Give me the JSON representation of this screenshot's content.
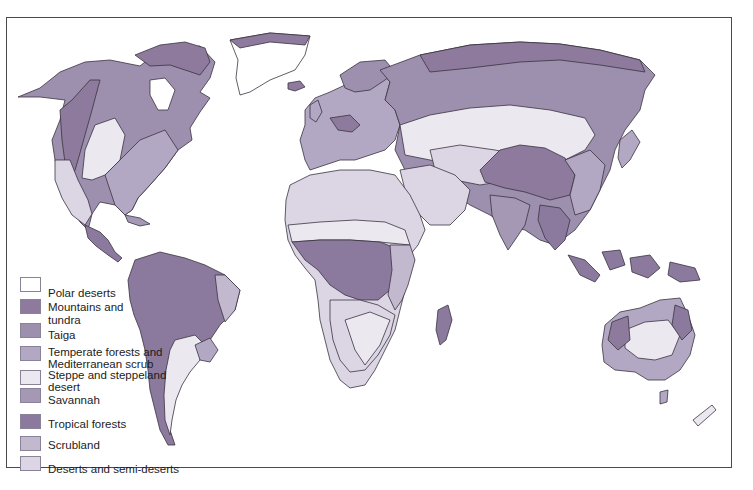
{
  "map": {
    "title": "World vegetation zones",
    "colors": {
      "polar": "#ffffff",
      "mountains": "#8e7a9c",
      "taiga": "#9d8fae",
      "temperate": "#b3a8c3",
      "steppe": "#ece8f0",
      "savannah": "#a498b5",
      "tropical": "#8b7a9d",
      "scrubland": "#c2b9cf",
      "deserts": "#dcd6e4",
      "outline": "#3a3340"
    }
  },
  "legend": {
    "items": [
      {
        "key": "polar",
        "label": "Polar deserts",
        "color": "#ffffff"
      },
      {
        "key": "mountains",
        "label": "Mountains and tundra",
        "line1": "Mountains and",
        "line2": "tundra",
        "color": "#8e7a9c"
      },
      {
        "key": "taiga",
        "label": "Taiga",
        "color": "#9d8fae"
      },
      {
        "key": "temperate",
        "label": "Temperate forests and Mediterranean scrub",
        "line1": "Temperate forests and",
        "line2": "Mediterranean scrub",
        "color": "#b3a8c3"
      },
      {
        "key": "steppe",
        "label": "Steppe and steppeland desert",
        "line1": "Steppe and steppeland",
        "line2": "desert",
        "color": "#ece8f0"
      },
      {
        "key": "savannah",
        "label": "Savannah",
        "color": "#a498b5"
      },
      {
        "key": "tropical",
        "label": "Tropical forests",
        "color": "#8b7a9d"
      },
      {
        "key": "scrubland",
        "label": "Scrubland",
        "color": "#c2b9cf"
      },
      {
        "key": "deserts",
        "label": "Deserts and semi-deserts",
        "color": "#dcd6e4"
      }
    ]
  }
}
